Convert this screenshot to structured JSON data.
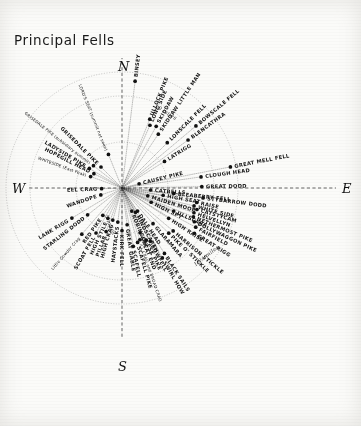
{
  "title": "Principal Fells",
  "compass": {
    "north": "N",
    "south": "S",
    "east": "E",
    "west": "W"
  },
  "scale_rings": [
    {
      "label": "5 miles",
      "radius_px": 46
    },
    {
      "label": "10 miles",
      "radius_px": 92
    },
    {
      "label": "12½ miles",
      "radius_px": 116
    }
  ],
  "center": {
    "x": 122,
    "y": 188
  },
  "chart_data": {
    "type": "scatter",
    "title": "Principal Fells",
    "subtitle": "Radial panorama of Lakeland fells seen from a central viewpoint",
    "coordinate_system": "polar",
    "angle_units": "degrees clockwise from North",
    "radius_units": "miles",
    "radius_range": [
      0,
      12.5
    ],
    "grid": "concentric distance arcs at 5, 10 and 12½ miles with dotted radial sight-lines",
    "legend": "none",
    "xlabel": "",
    "ylabel": "",
    "points": [
      {
        "name": "BINSEY",
        "bearing": 7,
        "distance": 11.6
      },
      {
        "name": "ULLOCK PIKE",
        "bearing": 22,
        "distance": 8.0
      },
      {
        "name": "LONG SIDE",
        "bearing": 24,
        "distance": 7.4
      },
      {
        "name": "SKIDDAW",
        "bearing": 29,
        "distance": 7.6
      },
      {
        "name": "SKIDDAW LITTLE MAN",
        "bearing": 34,
        "distance": 7.0
      },
      {
        "name": "LONSCALE FELL",
        "bearing": 45,
        "distance": 6.9
      },
      {
        "name": "BOWSCALE FELL",
        "bearing": 50,
        "distance": 10.4
      },
      {
        "name": "BLENCATHRA",
        "bearing": 54,
        "distance": 8.8
      },
      {
        "name": "LATRIGG",
        "bearing": 58,
        "distance": 5.4
      },
      {
        "name": "GREAT MELL FELL",
        "bearing": 79,
        "distance": 11.9
      },
      {
        "name": "CLOUGH HEAD",
        "bearing": 82,
        "distance": 8.6
      },
      {
        "name": "GREAT DODD",
        "bearing": 89,
        "distance": 8.6
      },
      {
        "name": "CAUSEY PIKE",
        "bearing": 76,
        "distance": 1.9
      },
      {
        "name": "CATBELLS",
        "bearing": 94,
        "distance": 3.1
      },
      {
        "name": "BLEABERRY FELL",
        "bearing": 96,
        "distance": 5.6
      },
      {
        "name": "STYBARROW DODD",
        "bearing": 97,
        "distance": 8.8
      },
      {
        "name": "HIGH SEAT",
        "bearing": 100,
        "distance": 4.5
      },
      {
        "name": "RAISE",
        "bearing": 101,
        "distance": 8.2
      },
      {
        "name": "WHITE SIDE",
        "bearing": 104,
        "distance": 8.0
      },
      {
        "name": "CATSTYCAM",
        "bearing": 106,
        "distance": 8.4
      },
      {
        "name": "HELVELLYN",
        "bearing": 109,
        "distance": 8.2
      },
      {
        "name": "NETHERMOST PIKE",
        "bearing": 112,
        "distance": 8.3
      },
      {
        "name": "DOLLYWAGGON PIKE",
        "bearing": 115,
        "distance": 8.6
      },
      {
        "name": "FAIRFIELD",
        "bearing": 118,
        "distance": 9.0
      },
      {
        "name": "GREAT RIGG",
        "bearing": 122,
        "distance": 9.2
      },
      {
        "name": "MAIDEN MOOR",
        "bearing": 107,
        "distance": 2.9
      },
      {
        "name": "ULLSCARF",
        "bearing": 114,
        "distance": 6.1
      },
      {
        "name": "HIGH SPY",
        "bearing": 116,
        "distance": 3.5
      },
      {
        "name": "HIGH RAISE",
        "bearing": 123,
        "distance": 6.0
      },
      {
        "name": "HARRISON STICKLE",
        "bearing": 130,
        "distance": 7.2
      },
      {
        "name": "PIKE O' STICKLE",
        "bearing": 134,
        "distance": 7.0
      },
      {
        "name": "GLARAMARA",
        "bearing": 139,
        "distance": 5.1
      },
      {
        "name": "BLACK SAILS",
        "bearing": 147,
        "distance": 8.4
      },
      {
        "name": "SWIRL HOW",
        "bearing": 150,
        "distance": 8.7
      },
      {
        "name": "BOWFELL",
        "bearing": 152,
        "distance": 6.5
      },
      {
        "name": "ESK PIKE",
        "bearing": 155,
        "distance": 6.2
      },
      {
        "name": "ILL CRAG and BROAD CRAG",
        "bearing": 161,
        "distance": 5.9
      },
      {
        "name": "SCAFELL PIKE",
        "bearing": 164,
        "distance": 6.1
      },
      {
        "name": "SCAFELL",
        "bearing": 169,
        "distance": 6.4
      },
      {
        "name": "GREAT END",
        "bearing": 158,
        "distance": 5.2
      },
      {
        "name": "GREAT GABLE",
        "bearing": 172,
        "distance": 4.0
      },
      {
        "name": "DALE HEAD",
        "bearing": 146,
        "distance": 3.0
      },
      {
        "name": "HINDSCARTH",
        "bearing": 151,
        "distance": 3.0
      },
      {
        "name": "ROBINSON",
        "bearing": 157,
        "distance": 2.7
      },
      {
        "name": "KIRK FELL",
        "bearing": 180,
        "distance": 4.6
      },
      {
        "name": "HAYSTACKS",
        "bearing": 187,
        "distance": 3.7
      },
      {
        "name": "HIGH CRAG",
        "bearing": 196,
        "distance": 3.6
      },
      {
        "name": "PILLAR",
        "bearing": 200,
        "distance": 5.0
      },
      {
        "name": "HIGH STILE",
        "bearing": 205,
        "distance": 3.6
      },
      {
        "name": "SCOAT FELL",
        "bearing": 210,
        "distance": 5.6
      },
      {
        "name": "RED PIKE",
        "bearing": 215,
        "distance": 3.6
      },
      {
        "name": "Little Gowder Crag",
        "bearing": 221,
        "distance": 6.6
      },
      {
        "name": "STARLING DODD",
        "bearing": 232,
        "distance": 4.7
      },
      {
        "name": "LANK RIGG",
        "bearing": 239,
        "distance": 6.3
      },
      {
        "name": "WANDOPE",
        "bearing": 252,
        "distance": 2.4
      },
      {
        "name": "EEL CRAG",
        "bearing": 268,
        "distance": 2.2
      },
      {
        "name": "WHITESIDE (East Peak)",
        "bearing": 290,
        "distance": 3.6
      },
      {
        "name": "HOPEGILL HEAD",
        "bearing": 297,
        "distance": 3.4
      },
      {
        "name": "LADYSIDE PIKE",
        "bearing": 301,
        "distance": 4.1
      },
      {
        "name": "GRISEDALE PIKE (subsidiary summit)",
        "bearing": 308,
        "distance": 3.9
      },
      {
        "name": "GRISEDALE PIKE",
        "bearing": 315,
        "distance": 3.2
      },
      {
        "name": "LORD'S SEAT (summit not seen)",
        "bearing": 338,
        "distance": 3.9
      }
    ]
  }
}
